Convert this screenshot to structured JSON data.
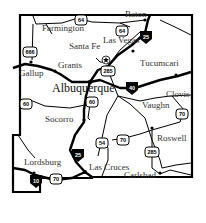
{
  "map": {
    "region": "New Mexico",
    "colors": {
      "background": "#ffffff",
      "lines": "#000000",
      "labels": "#333333"
    },
    "cities": [
      {
        "name": "Farmington",
        "x": 42,
        "y": 27
      },
      {
        "name": "Raton",
        "x": 125,
        "y": 14
      },
      {
        "name": "Las Vegas",
        "x": 104,
        "y": 40
      },
      {
        "name": "Santa Fe",
        "x": 69,
        "y": 46
      },
      {
        "name": "Grants",
        "x": 58,
        "y": 64
      },
      {
        "name": "Gallup",
        "x": 20,
        "y": 72
      },
      {
        "name": "Tucumcari",
        "x": 141,
        "y": 62
      },
      {
        "name": "Albuquerque",
        "x": 52,
        "y": 83
      },
      {
        "name": "Clovis",
        "x": 167,
        "y": 92
      },
      {
        "name": "Vaughn",
        "x": 143,
        "y": 104
      },
      {
        "name": "Socorro",
        "x": 45,
        "y": 118
      },
      {
        "name": "Roswell",
        "x": 157,
        "y": 137
      },
      {
        "name": "Lordsburg",
        "x": 24,
        "y": 160
      },
      {
        "name": "Las Cruces",
        "x": 89,
        "y": 166
      },
      {
        "name": "Carlsbad",
        "x": 124,
        "y": 174
      }
    ],
    "shields": [
      {
        "type": "us",
        "number": "64",
        "x": 81,
        "y": 20
      },
      {
        "type": "us",
        "number": "64",
        "x": 122,
        "y": 31
      },
      {
        "type": "interstate",
        "number": "25",
        "x": 146,
        "y": 37
      },
      {
        "type": "us",
        "number": "666",
        "x": 30,
        "y": 52
      },
      {
        "type": "us",
        "number": "285",
        "x": 108,
        "y": 71
      },
      {
        "type": "interstate",
        "number": "40",
        "x": 132,
        "y": 88
      },
      {
        "type": "us",
        "number": "60",
        "x": 26,
        "y": 104
      },
      {
        "type": "us",
        "number": "60",
        "x": 92,
        "y": 102
      },
      {
        "type": "us",
        "number": "70",
        "x": 182,
        "y": 114
      },
      {
        "type": "us",
        "number": "54",
        "x": 102,
        "y": 143
      },
      {
        "type": "us",
        "number": "70",
        "x": 123,
        "y": 140
      },
      {
        "type": "us",
        "number": "285",
        "x": 152,
        "y": 152
      },
      {
        "type": "interstate",
        "number": "25",
        "x": 78,
        "y": 155
      },
      {
        "type": "interstate",
        "number": "10",
        "x": 36,
        "y": 181
      },
      {
        "type": "us",
        "number": "70",
        "x": 56,
        "y": 179
      }
    ]
  }
}
